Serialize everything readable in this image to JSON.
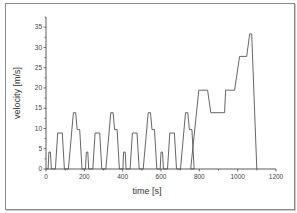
{
  "chart_data": {
    "type": "line",
    "title": "",
    "xlabel": "time [s]",
    "ylabel": "velocity [m/s]",
    "xlim": [
      0,
      1200
    ],
    "ylim": [
      0,
      37.5
    ],
    "xticks": [
      0,
      200,
      400,
      600,
      800,
      1000,
      1200
    ],
    "yticks": [
      0,
      5,
      10,
      15,
      20,
      25,
      30,
      35
    ],
    "grid": false,
    "legend": null,
    "series": [
      {
        "name": "velocity",
        "color": "#555555",
        "x": [
          0,
          11,
          15,
          23,
          28,
          49,
          61,
          85,
          96,
          117,
          143,
          155,
          163,
          176,
          188,
          195,
          206,
          210,
          218,
          223,
          244,
          256,
          280,
          291,
          312,
          338,
          350,
          358,
          371,
          383,
          390,
          401,
          405,
          413,
          418,
          439,
          451,
          475,
          486,
          507,
          533,
          545,
          553,
          566,
          578,
          585,
          596,
          600,
          608,
          613,
          634,
          646,
          670,
          681,
          702,
          728,
          740,
          748,
          761,
          773,
          755,
          797,
          843,
          860,
          932,
          937,
          984,
          1010,
          1047,
          1063,
          1073,
          1100
        ],
        "y": [
          0,
          0,
          4.17,
          4.17,
          0,
          0,
          8.89,
          8.89,
          0,
          0,
          13.89,
          13.89,
          9.72,
          9.72,
          0,
          0,
          0,
          4.17,
          4.17,
          0,
          0,
          8.89,
          8.89,
          0,
          0,
          13.89,
          13.89,
          9.72,
          9.72,
          0,
          0,
          0,
          4.17,
          4.17,
          0,
          0,
          8.89,
          8.89,
          0,
          0,
          13.89,
          13.89,
          9.72,
          9.72,
          0,
          0,
          0,
          4.17,
          4.17,
          0,
          0,
          8.89,
          8.89,
          0,
          0,
          13.89,
          13.89,
          9.72,
          9.72,
          0,
          0,
          19.44,
          19.44,
          13.89,
          13.89,
          19.44,
          19.44,
          27.78,
          27.78,
          33.33,
          33.33,
          0
        ]
      }
    ]
  }
}
